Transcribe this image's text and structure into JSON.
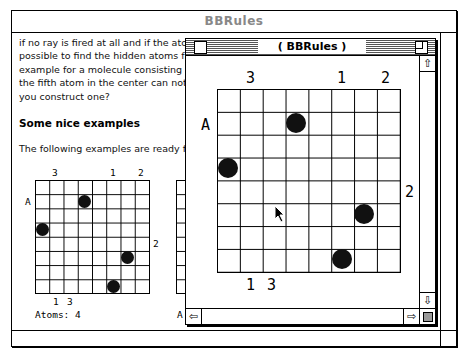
{
  "outer_window": {
    "title": "BBRules",
    "paragraph": "if no ray is fired at all and if the atoms ... possible to find the hidden atoms from ... example for a molecule consisting of 5 ... the fifth atom in the center can not be d... you construct one?",
    "paragraph_lines": [
      "if no ray is fired at all and if the ator",
      "possible to find the hidden atoms fron",
      "example for a molecule consisting of 5",
      "the fifth atom in the center can not be d",
      "you construct one?"
    ],
    "heading": "Some nice examples",
    "intro": "The following examples are ready for yo",
    "example1": {
      "top_labels": [
        "3",
        "1",
        "2"
      ],
      "left_labels": [
        "A"
      ],
      "right_labels": [
        "2"
      ],
      "bottom_labels": [
        "1",
        "3"
      ],
      "atoms_label": "Atoms: 4",
      "grid_size": 8,
      "atoms": [
        [
          1,
          3
        ],
        [
          3,
          0
        ],
        [
          5,
          6
        ],
        [
          7,
          5
        ]
      ]
    },
    "example2_partial_label": "A"
  },
  "inner_window": {
    "title": "( BBRules )",
    "grid": {
      "size": 8,
      "top_labels": [
        {
          "col": 1,
          "text": "3"
        },
        {
          "col": 5,
          "text": "1"
        },
        {
          "col": 7,
          "text": "2"
        }
      ],
      "left_labels": [
        {
          "row": 1,
          "text": "A"
        }
      ],
      "right_labels": [
        {
          "row": 4,
          "text": "2"
        }
      ],
      "bottom_labels": [
        {
          "col": 1,
          "text": "1"
        },
        {
          "col": 2,
          "text": "3"
        }
      ],
      "atoms": [
        [
          1,
          3
        ],
        [
          3,
          0
        ],
        [
          5,
          6
        ],
        [
          7,
          5
        ]
      ]
    },
    "scroll_up": "⇧",
    "scroll_down": "⇩",
    "scroll_left": "⇦",
    "scroll_right": "⇨"
  }
}
